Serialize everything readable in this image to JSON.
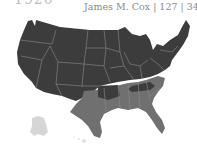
{
  "header": {
    "year": "1920",
    "candidate": "James M. Cox",
    "electoral_votes": "127",
    "popular_vote_pct": "34.1%",
    "caption": "James M. Cox | 127 | 34.1%"
  },
  "legend_colors": {
    "opponent_states": "#3d3c3d",
    "candidate_states": "#707070",
    "territories": "#d6d6d6",
    "borders": "#8c8c8c"
  },
  "map": {
    "title": "US presidential election map",
    "regions": [
      {
        "name": "opponent-won",
        "color": "#3d3c3d"
      },
      {
        "name": "candidate-won-south",
        "color": "#707070"
      },
      {
        "name": "alaska",
        "color": "#d6d6d6"
      },
      {
        "name": "hawaii",
        "color": "#e0e0e0"
      }
    ]
  }
}
